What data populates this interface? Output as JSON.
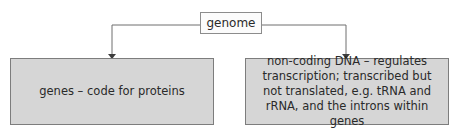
{
  "diagram": {
    "type": "hierarchy",
    "root": {
      "label": "genome"
    },
    "children": [
      {
        "label": "genes – code for proteins"
      },
      {
        "label": "non-coding DNA – regulates transcription; transcribed but not translated, e.g. tRNA and rRNA, and the introns within genes"
      }
    ],
    "colors": {
      "root_fill": "#fbfbfb",
      "leaf_fill": "#d6d6d6",
      "border": "#7d7d7d",
      "connector": "#6e6e6e",
      "text": "#2a2a2a"
    }
  }
}
